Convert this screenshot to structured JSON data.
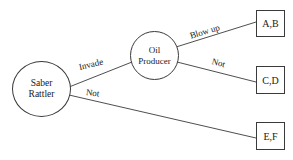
{
  "diagram": {
    "type": "decision-tree",
    "background_color": "#ffffff",
    "stroke_color": "#3a3a3a",
    "text_color": "#1a1a1a",
    "nodes": [
      {
        "id": "saber-rattler",
        "shape": "circle",
        "label_line1": "Saber",
        "label_line2": "Rattler"
      },
      {
        "id": "oil-producer",
        "shape": "circle",
        "label_line1": "Oil",
        "label_line2": "Producer"
      },
      {
        "id": "outcome-ab",
        "shape": "rect",
        "label": "A,B"
      },
      {
        "id": "outcome-cd",
        "shape": "rect",
        "label": "C,D"
      },
      {
        "id": "outcome-ef",
        "shape": "rect",
        "label": "E,F"
      }
    ],
    "edges": [
      {
        "id": "edge-invade",
        "from": "saber-rattler",
        "to": "oil-producer",
        "label": "Invade"
      },
      {
        "id": "edge-not-bot",
        "from": "saber-rattler",
        "to": "outcome-ef",
        "label": "Not"
      },
      {
        "id": "edge-blow-up",
        "from": "oil-producer",
        "to": "outcome-ab",
        "label": "Blow up"
      },
      {
        "id": "edge-not-top",
        "from": "oil-producer",
        "to": "outcome-cd",
        "label": "Not"
      }
    ]
  }
}
